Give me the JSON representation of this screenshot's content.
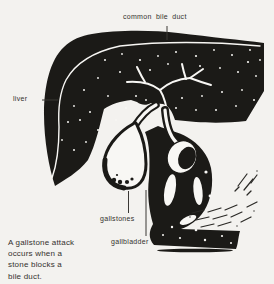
{
  "colors": {
    "paper": "#f3f2ef",
    "ink": "#1b1a17",
    "highlight": "#f8f7f4",
    "label_text": "#33312e"
  },
  "diagram": {
    "title_context": "Gallbladder and bile duct anatomy illustration",
    "labels": {
      "common_bile_duct": "common bile duct",
      "liver": "liver",
      "gallstones": "gallstones",
      "gallbladder": "gallbladder"
    },
    "caption": {
      "lines": [
        "A gallstone attack",
        "occurs when a",
        "stone blocks a",
        "bile duct."
      ]
    }
  }
}
